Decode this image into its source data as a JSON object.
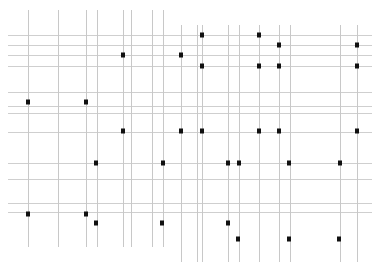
{
  "diagram": {
    "type": "dot-grid",
    "width": 377,
    "height": 272,
    "colors": {
      "grid_vertical": "#c8c8c8",
      "grid_horizontal": "#cfcfcf",
      "dot": "#111111",
      "background": "#ffffff"
    },
    "vertical_lines": [
      {
        "x": 28,
        "y1": 10,
        "y2": 247
      },
      {
        "x": 58,
        "y1": 10,
        "y2": 247
      },
      {
        "x": 86,
        "y1": 10,
        "y2": 247
      },
      {
        "x": 97,
        "y1": 10,
        "y2": 247
      },
      {
        "x": 123,
        "y1": 10,
        "y2": 247
      },
      {
        "x": 131,
        "y1": 10,
        "y2": 247
      },
      {
        "x": 152,
        "y1": 10,
        "y2": 247
      },
      {
        "x": 163,
        "y1": 10,
        "y2": 247
      },
      {
        "x": 181,
        "y1": 25,
        "y2": 262
      },
      {
        "x": 197,
        "y1": 25,
        "y2": 262
      },
      {
        "x": 202,
        "y1": 25,
        "y2": 262
      },
      {
        "x": 228,
        "y1": 25,
        "y2": 262
      },
      {
        "x": 239,
        "y1": 25,
        "y2": 262
      },
      {
        "x": 259,
        "y1": 25,
        "y2": 262
      },
      {
        "x": 279,
        "y1": 25,
        "y2": 262
      },
      {
        "x": 290,
        "y1": 25,
        "y2": 262
      },
      {
        "x": 340,
        "y1": 25,
        "y2": 262
      },
      {
        "x": 357,
        "y1": 25,
        "y2": 262
      }
    ],
    "horizontal_lines": [
      {
        "y": 35,
        "x1": 8,
        "x2": 372
      },
      {
        "y": 45,
        "x1": 8,
        "x2": 372
      },
      {
        "y": 55,
        "x1": 8,
        "x2": 372
      },
      {
        "y": 66,
        "x1": 8,
        "x2": 372
      },
      {
        "y": 92,
        "x1": 8,
        "x2": 372
      },
      {
        "y": 106,
        "x1": 8,
        "x2": 372
      },
      {
        "y": 113,
        "x1": 8,
        "x2": 372
      },
      {
        "y": 132,
        "x1": 8,
        "x2": 372
      },
      {
        "y": 163,
        "x1": 8,
        "x2": 372
      },
      {
        "y": 179,
        "x1": 8,
        "x2": 372
      },
      {
        "y": 203,
        "x1": 8,
        "x2": 372
      },
      {
        "y": 212,
        "x1": 8,
        "x2": 372
      }
    ],
    "dots": [
      {
        "x": 202,
        "y": 35
      },
      {
        "x": 259,
        "y": 35
      },
      {
        "x": 279,
        "y": 45
      },
      {
        "x": 357,
        "y": 45
      },
      {
        "x": 123,
        "y": 55
      },
      {
        "x": 181,
        "y": 55
      },
      {
        "x": 202,
        "y": 66
      },
      {
        "x": 259,
        "y": 66
      },
      {
        "x": 279,
        "y": 66
      },
      {
        "x": 357,
        "y": 66
      },
      {
        "x": 28,
        "y": 102
      },
      {
        "x": 86,
        "y": 102
      },
      {
        "x": 123,
        "y": 131
      },
      {
        "x": 181,
        "y": 131
      },
      {
        "x": 202,
        "y": 131
      },
      {
        "x": 259,
        "y": 131
      },
      {
        "x": 279,
        "y": 131
      },
      {
        "x": 357,
        "y": 131
      },
      {
        "x": 96,
        "y": 163
      },
      {
        "x": 163,
        "y": 163
      },
      {
        "x": 228,
        "y": 163
      },
      {
        "x": 239,
        "y": 163
      },
      {
        "x": 289,
        "y": 163
      },
      {
        "x": 340,
        "y": 163
      },
      {
        "x": 28,
        "y": 214
      },
      {
        "x": 86,
        "y": 214
      },
      {
        "x": 96,
        "y": 223
      },
      {
        "x": 162,
        "y": 223
      },
      {
        "x": 228,
        "y": 223
      },
      {
        "x": 238,
        "y": 239
      },
      {
        "x": 289,
        "y": 239
      },
      {
        "x": 339,
        "y": 239
      }
    ],
    "dot_size": 4
  }
}
